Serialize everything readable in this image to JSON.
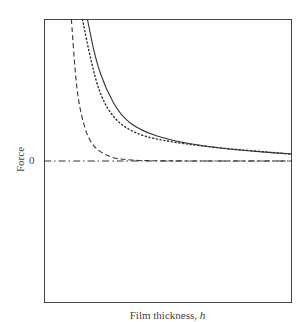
{
  "chart_data": {
    "type": "line",
    "title": "",
    "xlabel": "Film thickness, h",
    "xlabel_text": "Film thickness, ",
    "xlabel_var": "h",
    "ylabel": "Force",
    "yticks": [
      "0"
    ],
    "grid": false,
    "legend": null,
    "xlim": [
      0,
      1
    ],
    "ylim": [
      -1,
      1
    ],
    "series": [
      {
        "name": "total (solid)",
        "style": "solid",
        "points": [
          [
            0.174,
            1.0
          ],
          [
            0.206,
            0.722
          ],
          [
            0.247,
            0.514
          ],
          [
            0.308,
            0.319
          ],
          [
            0.389,
            0.215
          ],
          [
            0.51,
            0.146
          ],
          [
            0.672,
            0.097
          ],
          [
            0.834,
            0.069
          ],
          [
            1.0,
            0.049
          ]
        ]
      },
      {
        "name": "dotted",
        "style": "dotted",
        "points": [
          [
            0.154,
            1.0
          ],
          [
            0.186,
            0.722
          ],
          [
            0.226,
            0.458
          ],
          [
            0.287,
            0.285
          ],
          [
            0.368,
            0.194
          ],
          [
            0.47,
            0.146
          ],
          [
            0.672,
            0.097
          ],
          [
            1.0,
            0.049
          ]
        ]
      },
      {
        "name": "dashed",
        "style": "dashed",
        "points": [
          [
            0.109,
            1.0
          ],
          [
            0.126,
            0.576
          ],
          [
            0.146,
            0.333
          ],
          [
            0.186,
            0.111
          ],
          [
            0.267,
            0.021
          ],
          [
            0.348,
            0.007
          ],
          [
            0.45,
            0.0
          ],
          [
            1.0,
            0.0
          ]
        ]
      },
      {
        "name": "zero baseline",
        "style": "dash-dot",
        "points": [
          [
            0.0,
            0.0
          ],
          [
            1.0,
            0.0
          ]
        ]
      }
    ]
  }
}
